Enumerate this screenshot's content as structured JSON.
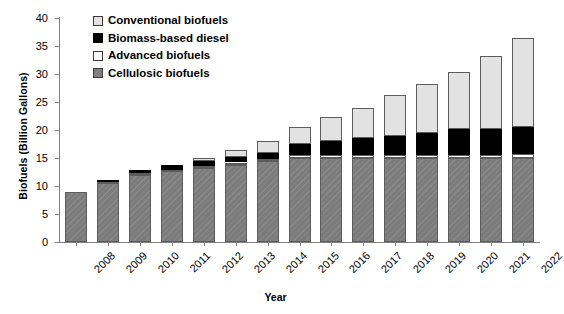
{
  "chart_data": {
    "type": "bar",
    "stacked": true,
    "title": "",
    "xlabel": "Year",
    "ylabel": "Biofuels (Billion Gallons)",
    "ylim": [
      0,
      40
    ],
    "yticks": [
      0,
      5,
      10,
      15,
      20,
      25,
      30,
      35,
      40
    ],
    "grid": false,
    "legend_position": "top-left",
    "categories": [
      "2008",
      "2009",
      "2010",
      "2011",
      "2012",
      "2013",
      "2014",
      "2015",
      "2016",
      "2017",
      "2018",
      "2019",
      "2020",
      "2021",
      "2022"
    ],
    "series": [
      {
        "name": "Cellulosic biofuels",
        "color": "#7c7c7c",
        "values": [
          9.0,
          10.5,
          12.0,
          12.6,
          13.2,
          13.8,
          14.4,
          15.0,
          15.0,
          15.0,
          15.0,
          15.0,
          15.0,
          15.0,
          15.0
        ]
      },
      {
        "name": "Advanced biofuels",
        "color": "#ffffff",
        "values": [
          0.0,
          0.2,
          0.25,
          0.3,
          0.35,
          0.4,
          0.45,
          0.5,
          0.5,
          0.5,
          0.5,
          0.5,
          0.6,
          0.6,
          0.7
        ]
      },
      {
        "name": "Biomass-based diesel",
        "color": "#000000",
        "values": [
          0.0,
          0.1,
          0.55,
          0.8,
          1.0,
          1.0,
          1.0,
          2.0,
          2.5,
          3.0,
          3.5,
          4.0,
          4.5,
          4.5,
          4.8
        ]
      },
      {
        "name": "Conventional biofuels",
        "color": "#e2e2e2",
        "values": [
          0.0,
          0.0,
          0.0,
          0.0,
          0.45,
          1.3,
          2.15,
          3.0,
          4.4,
          5.5,
          7.2,
          8.7,
          10.2,
          13.2,
          15.9
        ]
      }
    ],
    "totals": [
      9.0,
      10.8,
      12.8,
      13.7,
      15.0,
      16.5,
      18.0,
      20.5,
      22.4,
      24.0,
      26.2,
      28.2,
      30.3,
      33.3,
      36.4
    ]
  },
  "legend": {
    "items": [
      {
        "label": "Conventional biofuels",
        "swatch": "conv"
      },
      {
        "label": "Biomass-based diesel",
        "swatch": "bio"
      },
      {
        "label": "Advanced biofuels",
        "swatch": "adv"
      },
      {
        "label": "Cellulosic biofuels",
        "swatch": "cell"
      }
    ]
  }
}
